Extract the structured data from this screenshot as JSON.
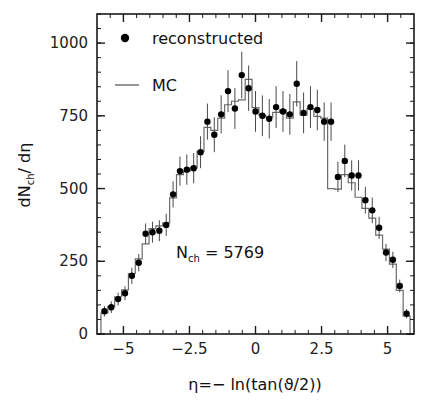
{
  "chart_data": {
    "type": "line",
    "title": "",
    "xlabel": "η=− ln(tan(ϑ/2))",
    "ylabel": "dN",
    "ylabel_sub": "ch",
    "ylabel_tail": "/ dη",
    "xlim": [
      -6.0,
      6.0
    ],
    "ylim": [
      0,
      1100
    ],
    "grid": false,
    "xticks": [
      -5,
      -2.5,
      0,
      2.5,
      5
    ],
    "xtick_labels": [
      "−5",
      "−2.5",
      "0",
      "2.5",
      "5"
    ],
    "x_minor_step": 0.5,
    "yticks": [
      0,
      250,
      500,
      750,
      1000
    ],
    "ytick_labels": [
      "0",
      "250",
      "500",
      "750",
      "1000"
    ],
    "y_minor_step": 50,
    "annotation": {
      "text_lead": "N",
      "text_sub": "ch",
      "text_tail": " = 5769",
      "full": "N_ch = 5769",
      "x": -1.4,
      "y": 300
    },
    "legend": {
      "position": "upper-left-inside",
      "entries": [
        {
          "name": "reconstructed",
          "marker": "filled-circle",
          "color": "#000000"
        },
        {
          "name": "MC",
          "marker": "step-line",
          "color": "#555555"
        }
      ]
    },
    "series": [
      {
        "name": "reconstructed",
        "type": "scatter-with-errorbars",
        "marker": "filled-circle",
        "color": "#000000",
        "x": [
          -5.72,
          -5.46,
          -5.2,
          -4.94,
          -4.68,
          -4.42,
          -4.16,
          -3.9,
          -3.64,
          -3.38,
          -3.12,
          -2.86,
          -2.6,
          -2.34,
          -2.08,
          -1.82,
          -1.56,
          -1.3,
          -1.04,
          -0.78,
          -0.52,
          -0.26,
          0.0,
          0.26,
          0.52,
          0.78,
          1.04,
          1.3,
          1.56,
          1.82,
          2.08,
          2.34,
          2.6,
          2.86,
          3.12,
          3.38,
          3.64,
          3.9,
          4.16,
          4.42,
          4.68,
          4.94,
          5.2,
          5.46,
          5.72
        ],
        "y": [
          78,
          92,
          120,
          140,
          200,
          245,
          345,
          350,
          355,
          375,
          480,
          560,
          565,
          570,
          625,
          730,
          685,
          755,
          835,
          775,
          890,
          845,
          765,
          750,
          740,
          780,
          765,
          755,
          860,
          760,
          780,
          770,
          730,
          730,
          540,
          595,
          545,
          545,
          460,
          425,
          365,
          280,
          255,
          165,
          70
        ],
        "yerr": [
          18,
          20,
          22,
          24,
          28,
          30,
          35,
          36,
          36,
          38,
          45,
          50,
          52,
          52,
          55,
          62,
          60,
          66,
          72,
          70,
          80,
          78,
          70,
          70,
          68,
          72,
          70,
          70,
          78,
          70,
          72,
          70,
          66,
          66,
          52,
          56,
          52,
          52,
          46,
          44,
          38,
          30,
          28,
          22,
          16
        ]
      },
      {
        "name": "MC",
        "type": "step-histogram",
        "color": "#6b6b6b",
        "bin_edges": [
          -5.85,
          -5.59,
          -5.33,
          -5.07,
          -4.81,
          -4.55,
          -4.29,
          -4.03,
          -3.77,
          -3.51,
          -3.25,
          -2.99,
          -2.73,
          -2.47,
          -2.21,
          -1.95,
          -1.69,
          -1.43,
          -1.17,
          -0.91,
          -0.65,
          -0.39,
          -0.13,
          0.13,
          0.39,
          0.65,
          0.91,
          1.17,
          1.43,
          1.69,
          1.95,
          2.21,
          2.47,
          2.73,
          2.99,
          3.25,
          3.51,
          3.77,
          4.03,
          4.29,
          4.55,
          4.81,
          5.07,
          5.33,
          5.59,
          5.85
        ],
        "values": [
          72,
          95,
          128,
          152,
          208,
          258,
          310,
          362,
          372,
          382,
          468,
          548,
          560,
          572,
          628,
          710,
          700,
          742,
          788,
          800,
          805,
          875,
          778,
          752,
          745,
          762,
          770,
          742,
          798,
          752,
          775,
          748,
          742,
          500,
          498,
          548,
          520,
          470,
          432,
          398,
          340,
          292,
          240,
          150,
          62
        ]
      }
    ]
  },
  "figure": {
    "plot_frame": {
      "left": 97,
      "top": 14,
      "right": 414,
      "bottom": 334
    },
    "background": "#ffffff",
    "frame_color": "#1a1a1a"
  }
}
